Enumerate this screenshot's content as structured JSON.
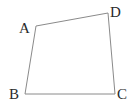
{
  "diagram": {
    "type": "quadrilateral",
    "vertices": [
      {
        "name": "A",
        "x": 36,
        "y": 26,
        "label_x": 19,
        "label_y": 33
      },
      {
        "name": "D",
        "x": 108,
        "y": 13,
        "label_x": 110,
        "label_y": 17
      },
      {
        "name": "B",
        "x": 25,
        "y": 94,
        "label_x": 9,
        "label_y": 99
      },
      {
        "name": "C",
        "x": 115,
        "y": 94,
        "label_x": 117,
        "label_y": 99
      }
    ],
    "edges": [
      [
        "A",
        "D"
      ],
      [
        "D",
        "C"
      ],
      [
        "C",
        "B"
      ],
      [
        "B",
        "A"
      ]
    ],
    "labels": {
      "a": "A",
      "b": "B",
      "c": "C",
      "d": "D"
    },
    "stroke_color": "#8a8a8a",
    "label_color": "#2a2a2a"
  }
}
